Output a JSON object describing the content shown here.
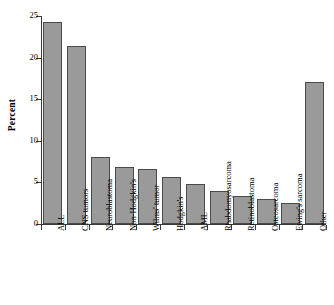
{
  "chart_data": {
    "type": "bar",
    "title": "",
    "subtitle": "",
    "xlabel": "",
    "ylabel": "Percent",
    "ylim": [
      0,
      25
    ],
    "yticks": [
      0,
      5,
      10,
      15,
      20,
      25
    ],
    "grid": false,
    "legend": null,
    "bar_color": "#9a9a9a",
    "bar_edge_color": "#4a4a4a",
    "axis_color": "#3a3a3a",
    "categories": [
      "ALL",
      "CNS tumors",
      "Neuroblastoma",
      "Non-Hodgkin's",
      "Wilms' tumor",
      "Hodgkin's",
      "AML",
      "Rhabdomyosarcoma",
      "Retinoblastoma",
      "Osteosarcoma",
      "Ewing's sarcoma",
      "Other"
    ],
    "values": [
      24.3,
      21.4,
      8.0,
      6.9,
      6.6,
      5.6,
      4.8,
      4.0,
      3.4,
      3.0,
      2.5,
      17.1
    ]
  }
}
